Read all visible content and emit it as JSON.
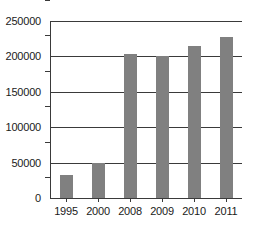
{
  "chart_data": {
    "type": "bar",
    "title": "",
    "subtitle": "",
    "xlabel": "",
    "ylabel": "",
    "categories": [
      "1995",
      "2000",
      "2008",
      "2009",
      "2010",
      "2011"
    ],
    "values": [
      33000,
      50000,
      203000,
      200000,
      215000,
      227000
    ],
    "series": [
      {
        "name": "",
        "values": [
          33000,
          50000,
          203000,
          200000,
          215000,
          227000
        ]
      }
    ],
    "ylim": [
      0,
      250000
    ],
    "yticks": [
      0,
      50000,
      100000,
      150000,
      200000,
      250000
    ],
    "ytick_labels": [
      "0",
      "50000",
      "100000",
      "150000",
      "200000",
      "250000"
    ],
    "grid": true,
    "legend": false,
    "legend_position": "none",
    "bar_color": "#808080",
    "axis_color": "#3a3a3a",
    "background_color": "#ffffff"
  }
}
